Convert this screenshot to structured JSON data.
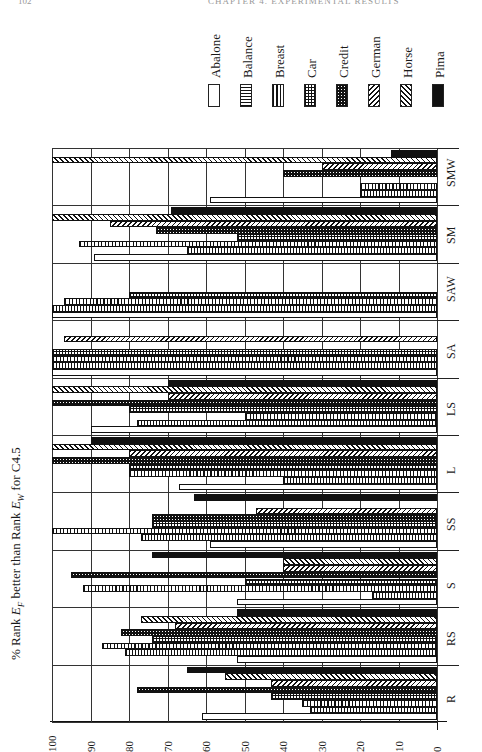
{
  "page": {
    "page_number": "102",
    "running_head": "CHAPTER 4. EXPERIMENTAL RESULTS"
  },
  "chart_data": {
    "type": "bar",
    "orientation": "rotated page; bars extend from 0 (right) toward 100 (left)",
    "title_parts": {
      "prefix": "% Rank ",
      "ef_main": "E",
      "ef_sub": "F",
      "middle": " better than Rank ",
      "ew_main": "E",
      "ew_sub": "W",
      "suffix": " for C4.5"
    },
    "xlabel": "",
    "ylabel": "% Rank E_F better than Rank E_W for C4.5",
    "ylim": [
      0,
      100
    ],
    "yticks": [
      100,
      90,
      80,
      70,
      60,
      50,
      40,
      30,
      20,
      10,
      0
    ],
    "grid": true,
    "legend_position": "top-right",
    "categories": [
      "R",
      "RS",
      "S",
      "SS",
      "L",
      "LS",
      "SA",
      "SAW",
      "SM",
      "SMW"
    ],
    "series": [
      {
        "name": "Abalone",
        "pattern": "empty",
        "values": [
          61,
          52,
          52,
          59,
          67,
          90,
          100,
          100,
          89,
          59
        ]
      },
      {
        "name": "Balance",
        "pattern": "horizontal-lines",
        "values": [
          33,
          81,
          17,
          77,
          40,
          78,
          100,
          100,
          65,
          20
        ]
      },
      {
        "name": "Breast",
        "pattern": "vertical-lines",
        "values": [
          35,
          87,
          92,
          100,
          80,
          50,
          100,
          97,
          93,
          20
        ]
      },
      {
        "name": "Car",
        "pattern": "grid",
        "values": [
          43,
          74,
          50,
          74,
          80,
          80,
          100,
          80,
          52,
          0
        ]
      },
      {
        "name": "Credit",
        "pattern": "dotted-dark",
        "values": [
          78,
          82,
          95,
          74,
          100,
          100,
          0,
          0,
          73,
          40
        ]
      },
      {
        "name": "German",
        "pattern": "backslash-hatch",
        "values": [
          43,
          68,
          40,
          47,
          80,
          70,
          97,
          0,
          85,
          30
        ]
      },
      {
        "name": "Horse",
        "pattern": "slash-hatch",
        "values": [
          55,
          77,
          40,
          0,
          100,
          100,
          0,
          0,
          100,
          100
        ]
      },
      {
        "name": "Pima",
        "pattern": "solid-black",
        "values": [
          65,
          52,
          74,
          63,
          90,
          70,
          0,
          0,
          69,
          12
        ]
      }
    ]
  },
  "legend": {
    "items": [
      {
        "label": "Abalone",
        "cls": "p-abalone"
      },
      {
        "label": "Balance",
        "cls": "p-balance"
      },
      {
        "label": "Breast",
        "cls": "p-breast"
      },
      {
        "label": "Car",
        "cls": "p-car"
      },
      {
        "label": "Credit",
        "cls": "p-credit"
      },
      {
        "label": "German",
        "cls": "p-german"
      },
      {
        "label": "Horse",
        "cls": "p-horse"
      },
      {
        "label": "Pima",
        "cls": "p-pima"
      }
    ]
  }
}
